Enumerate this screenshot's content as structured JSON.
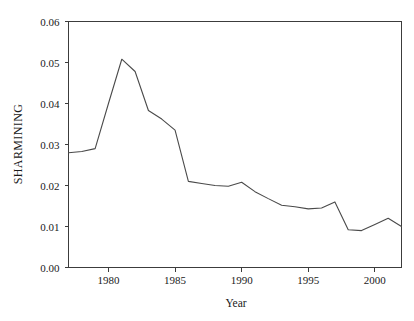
{
  "chart_data": {
    "type": "line",
    "title": "",
    "xlabel": "Year",
    "ylabel": "SHARMINING",
    "xlim": [
      1977,
      2002
    ],
    "ylim": [
      0.0,
      0.06
    ],
    "grid": false,
    "legend": false,
    "legend_position": "none",
    "line_color": "#4a4a4a",
    "axis_color": "#3c3c3c",
    "xticks": [
      1980,
      1985,
      1990,
      1995,
      2000
    ],
    "xtick_labels": [
      "1980",
      "1985",
      "1990",
      "1995",
      "2000"
    ],
    "yticks": [
      0.0,
      0.01,
      0.02,
      0.03,
      0.04,
      0.05,
      0.06
    ],
    "ytick_labels": [
      "0.00",
      "0.01",
      "0.02",
      "0.03",
      "0.04",
      "0.05",
      "0.06"
    ],
    "x": [
      1977,
      1978,
      1979,
      1980,
      1981,
      1982,
      1983,
      1984,
      1985,
      1986,
      1987,
      1988,
      1989,
      1990,
      1991,
      1992,
      1993,
      1994,
      1995,
      1996,
      1997,
      1998,
      1999,
      2000,
      2001,
      2002
    ],
    "values": [
      0.028,
      0.0283,
      0.029,
      0.04,
      0.0508,
      0.0478,
      0.0383,
      0.0362,
      0.0335,
      0.021,
      0.0205,
      0.02,
      0.0198,
      0.0208,
      0.0185,
      0.0168,
      0.0152,
      0.0148,
      0.0143,
      0.0145,
      0.016,
      0.0092,
      0.009,
      0.0105,
      0.012,
      0.01
    ],
    "series": [
      {
        "name": "SHARMINING",
        "values": [
          0.028,
          0.0283,
          0.029,
          0.04,
          0.0508,
          0.0478,
          0.0383,
          0.0362,
          0.0335,
          0.021,
          0.0205,
          0.02,
          0.0198,
          0.0208,
          0.0185,
          0.0168,
          0.0152,
          0.0148,
          0.0143,
          0.0145,
          0.016,
          0.0092,
          0.009,
          0.0105,
          0.012,
          0.01
        ]
      }
    ]
  }
}
